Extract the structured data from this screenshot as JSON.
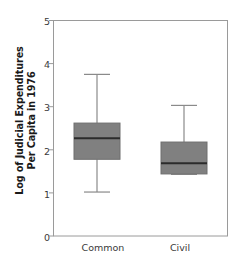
{
  "chart_data": {
    "type": "box",
    "title": "",
    "xlabel": "",
    "ylabel_line1": "Log of Judicial Expenditures",
    "ylabel_line2": "Per Capita in 1976",
    "ylim": [
      0,
      5
    ],
    "yticks": [
      "0",
      "1",
      "2",
      "3",
      "4",
      "5"
    ],
    "ytick_values": [
      0,
      1,
      2,
      3,
      4,
      5
    ],
    "grid": false,
    "legend": null,
    "categories": [
      "Common",
      "Civil"
    ],
    "box_fill_color": "#808080",
    "box_edge_color": "#6e6e6e",
    "median_color": "#2b2b2b",
    "whisker_color": "#8a8a8a",
    "frame_color": "#9a9a9a",
    "boxes": [
      {
        "name": "Common",
        "whisker_low": 1.02,
        "q1": 1.78,
        "median": 2.27,
        "q3": 2.62,
        "whisker_high": 3.75
      },
      {
        "name": "Civil",
        "whisker_low": 1.43,
        "q1": 1.44,
        "median": 1.69,
        "q3": 2.18,
        "whisker_high": 3.03
      }
    ]
  }
}
